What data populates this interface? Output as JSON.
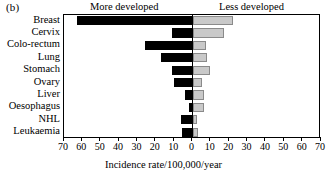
{
  "figure": {
    "panel_label": "(b)",
    "left_heading": "More developed",
    "right_heading": "Less developed",
    "x_axis_title": "Incidence rate/100,000/year"
  },
  "chart_data": {
    "type": "bar",
    "orientation": "horizontal",
    "subtype": "bidirectional-pyramid",
    "title": "",
    "panel": "(b)",
    "xlabel": "Incidence rate/100,000/year",
    "ylabel": "",
    "xlim": [
      -70,
      70
    ],
    "xticks": [
      -70,
      -60,
      -50,
      -40,
      -30,
      -20,
      -10,
      0,
      10,
      20,
      30,
      40,
      50,
      60,
      70
    ],
    "xtick_labels": [
      "70",
      "60",
      "50",
      "40",
      "30",
      "20",
      "10",
      "0",
      "10",
      "20",
      "30",
      "40",
      "50",
      "60",
      "70"
    ],
    "grid": false,
    "legend_position": "top",
    "categories": [
      "Breast",
      "Cervix",
      "Colo-rectum",
      "Lung",
      "Stomach",
      "Ovary",
      "Liver",
      "Oesophagus",
      "NHL",
      "Leukaemia"
    ],
    "series": [
      {
        "name": "More developed",
        "direction": "left",
        "color": "#000000",
        "values": [
          63,
          11,
          26,
          17,
          11,
          10,
          4,
          2,
          6,
          5.5
        ]
      },
      {
        "name": "Less developed",
        "direction": "right",
        "color": "#c9c9c9",
        "values": [
          22,
          17,
          7.5,
          8,
          9.5,
          5,
          6.5,
          6,
          2.7,
          2.8
        ]
      }
    ]
  }
}
